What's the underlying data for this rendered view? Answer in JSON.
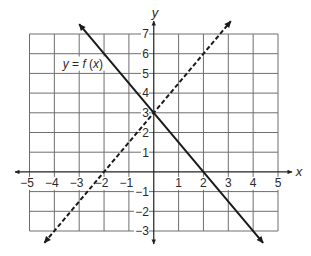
{
  "chart_data": {
    "type": "line",
    "title": "",
    "xlabel": "x",
    "ylabel": "y",
    "xlim": [
      -5,
      5
    ],
    "ylim": [
      -3,
      7
    ],
    "grid": true,
    "legend": null,
    "xticks": [
      -5,
      -4,
      -3,
      -2,
      -1,
      1,
      2,
      3,
      4,
      5
    ],
    "xtick_labels": [
      "−5",
      "−4",
      "−3",
      "−2",
      "−1",
      "1",
      "2",
      "3",
      "4",
      "5"
    ],
    "yticks": [
      -3,
      -2,
      -1,
      1,
      2,
      3,
      4,
      5,
      6,
      7
    ],
    "ytick_labels": [
      "−3",
      "−2",
      "−1",
      "1",
      "2",
      "3",
      "4",
      "5",
      "6",
      "7"
    ],
    "series": [
      {
        "name": "y = f (x)",
        "line_style": "solid",
        "arrows": "both",
        "x": [
          -3.0,
          0,
          2,
          4.4
        ],
        "y": [
          7.5,
          3,
          0,
          -3.6
        ]
      },
      {
        "name": "",
        "line_style": "dashed",
        "arrows": "both",
        "x": [
          -4.4,
          -2,
          0,
          3.1
        ],
        "y": [
          -3.6,
          0,
          3,
          7.65
        ]
      }
    ],
    "annotations": [
      {
        "text": "y = f (x)",
        "x": -2.85,
        "y": 5.5
      }
    ]
  },
  "colors": {
    "background": "#ffffff",
    "grid": "#6e6e6e",
    "axis": "#222222",
    "line": "#1a1a1a",
    "text": "#2a2a2a"
  }
}
